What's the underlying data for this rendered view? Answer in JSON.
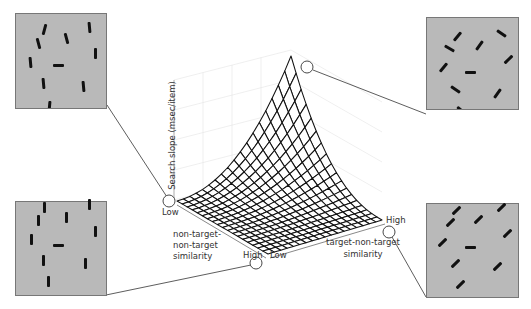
{
  "figure": {
    "type": "3d-surface-diagram",
    "z_axis_label": "Search slope (msec/item)",
    "x_axis_label": "target-non-target similarity",
    "y_axis_label_lines": [
      "non-target-",
      "non-target",
      "similarity"
    ],
    "tick_labels": {
      "origin_low": "Low",
      "y_high": "High",
      "x_low": "Low",
      "x_high": "High"
    }
  },
  "colors": {
    "panel_fill": "#b9b9b9",
    "panel_border": "#777777",
    "bar": "#111111",
    "mesh_line": "#111111",
    "mesh_fill": "#ffffff",
    "connector": "#333333",
    "grid": "#e4e4e4"
  },
  "panels": [
    {
      "id": "top-left",
      "description": "vertical target among vertical-ish distractors (low target-non-target similarity, low NT-NT similarity)",
      "target": {
        "x": 57,
        "y": 64,
        "w": 12,
        "h": 4,
        "angle": 0
      },
      "distractors": [
        {
          "x": 43,
          "y": 28,
          "angle": 15
        },
        {
          "x": 88,
          "y": 26,
          "angle": -5
        },
        {
          "x": 37,
          "y": 42,
          "angle": -15
        },
        {
          "x": 65,
          "y": 37,
          "angle": -15
        },
        {
          "x": 94,
          "y": 52,
          "angle": 0
        },
        {
          "x": 29,
          "y": 61,
          "angle": -5
        },
        {
          "x": 42,
          "y": 82,
          "angle": -5
        },
        {
          "x": 82,
          "y": 85,
          "angle": -5
        },
        {
          "x": 48,
          "y": 105,
          "angle": 5
        }
      ]
    },
    {
      "id": "top-right",
      "description": "oblique distractors, horizontal target",
      "target": {
        "x": 58,
        "y": 67,
        "w": 12,
        "h": 4,
        "angle": 0
      },
      "distractors": [
        {
          "x": 45,
          "y": 31,
          "angle": 40
        },
        {
          "x": 89,
          "y": 28,
          "angle": -55
        },
        {
          "x": 37,
          "y": 43,
          "angle": -60
        },
        {
          "x": 67,
          "y": 40,
          "angle": 35
        },
        {
          "x": 96,
          "y": 54,
          "angle": 45
        },
        {
          "x": 31,
          "y": 62,
          "angle": 40
        },
        {
          "x": 43,
          "y": 84,
          "angle": -55
        },
        {
          "x": 85,
          "y": 88,
          "angle": 35
        },
        {
          "x": 49,
          "y": 105,
          "angle": -50
        }
      ]
    },
    {
      "id": "bottom-left",
      "description": "vertical distractors, horizontal target",
      "target": {
        "x": 57,
        "y": 56,
        "w": 12,
        "h": 4,
        "angle": 0
      },
      "distractors": [
        {
          "x": 43,
          "y": 18,
          "angle": 0
        },
        {
          "x": 88,
          "y": 15,
          "angle": 0
        },
        {
          "x": 37,
          "y": 31,
          "angle": 0
        },
        {
          "x": 65,
          "y": 28,
          "angle": 0
        },
        {
          "x": 94,
          "y": 42,
          "angle": 0
        },
        {
          "x": 30,
          "y": 50,
          "angle": 0
        },
        {
          "x": 42,
          "y": 71,
          "angle": 0
        },
        {
          "x": 84,
          "y": 74,
          "angle": 0
        },
        {
          "x": 47,
          "y": 92,
          "angle": 0
        }
      ]
    },
    {
      "id": "bottom-right",
      "description": "oblique (same orientation) distractors, horizontal target",
      "target": {
        "x": 58,
        "y": 56,
        "w": 12,
        "h": 4,
        "angle": 0
      },
      "distractors": [
        {
          "x": 44,
          "y": 19,
          "angle": 45
        },
        {
          "x": 89,
          "y": 16,
          "angle": 45
        },
        {
          "x": 38,
          "y": 31,
          "angle": 45
        },
        {
          "x": 66,
          "y": 28,
          "angle": 45
        },
        {
          "x": 95,
          "y": 42,
          "angle": 45
        },
        {
          "x": 30,
          "y": 51,
          "angle": 45
        },
        {
          "x": 43,
          "y": 72,
          "angle": 45
        },
        {
          "x": 85,
          "y": 75,
          "angle": 45
        },
        {
          "x": 48,
          "y": 93,
          "angle": 45
        }
      ]
    }
  ],
  "callouts": [
    {
      "id": "low-low",
      "cx": 169,
      "cy": 201,
      "to": "top-left"
    },
    {
      "id": "peak",
      "cx": 307,
      "cy": 67,
      "to": "top-right"
    },
    {
      "id": "nt-high",
      "cx": 256,
      "cy": 263,
      "to": "bottom-left"
    },
    {
      "id": "tnt-high",
      "cx": 389,
      "cy": 232,
      "to": "bottom-right"
    }
  ]
}
